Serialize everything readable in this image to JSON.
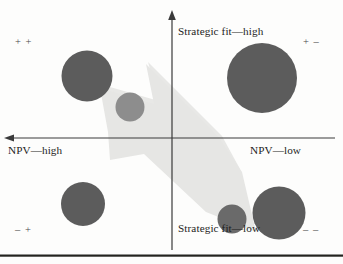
{
  "figure": {
    "type": "scatter-quadrant-matrix",
    "background_color": "#fdfdfc",
    "bubble_color": "#5c5c5c",
    "bubble_color_light": "#8d8d8d",
    "arrow_color": "#e6e6e4",
    "axis_color": "#3a3a3a",
    "rule_color": "#23231f"
  },
  "axes": {
    "vertical": {
      "top_label": "Strategic fit—high",
      "bottom_label": "Strategic fit—low",
      "arrow_at": "top",
      "x_position": 172
    },
    "horizontal": {
      "left_label": "NPV—high",
      "right_label": "NPV—low",
      "arrow_at": "left",
      "y_position": 138
    }
  },
  "quadrant_signs": {
    "top_left": "+ +",
    "top_right": "+ –",
    "bottom_left": "– +",
    "bottom_right": "– –"
  },
  "chart_data": {
    "type": "scatter",
    "title": "",
    "xlabel": "NPV",
    "ylabel": "Strategic fit",
    "x_axis_direction": "NPV high (left) to NPV low (right)",
    "y_axis_direction": "Strategic fit low (bottom) to high (top)",
    "grid": false,
    "legend": null,
    "origin_px": [
      172,
      138
    ],
    "bubbles": [
      {
        "name": "bubble-top-left-large",
        "cx": 87,
        "cy": 76,
        "r": 25.5,
        "quadrant": "top_left",
        "color": "#5c5c5c"
      },
      {
        "name": "bubble-top-left-small",
        "cx": 130,
        "cy": 107,
        "r": 14.5,
        "quadrant": "top_left",
        "color": "#8d8d8d"
      },
      {
        "name": "bubble-top-right-large",
        "cx": 262,
        "cy": 78,
        "r": 35.0,
        "quadrant": "top_right",
        "color": "#5c5c5c"
      },
      {
        "name": "bubble-bottom-left",
        "cx": 83,
        "cy": 204,
        "r": 22.0,
        "quadrant": "bottom_left",
        "color": "#5c5c5c"
      },
      {
        "name": "bubble-bottom-mid-small",
        "cx": 232,
        "cy": 219,
        "r": 14.5,
        "quadrant": "bottom_right",
        "color": "#6a6a6a"
      },
      {
        "name": "bubble-bottom-right",
        "cx": 279,
        "cy": 213,
        "r": 26.5,
        "quadrant": "bottom_right",
        "color": "#5c5c5c"
      }
    ],
    "annotation_arrow": {
      "name": "improvement-arrow",
      "direction": "from bottom-right (NPV low / low strategic fit) to top-left (NPV high / high strategic fit)",
      "color": "#e6e6e4",
      "tail_px": [
        248,
        232
      ],
      "head_px": [
        110,
        92
      ]
    }
  }
}
